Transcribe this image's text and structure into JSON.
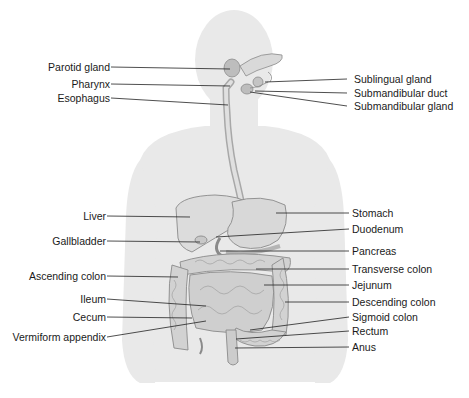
{
  "colors": {
    "silhouette": "#e9e9e9",
    "organ_fill": "#d6d6d6",
    "organ_stroke": "#8a8a8a",
    "leader_line": "#222222",
    "text": "#1a1a1a"
  },
  "labels_left": [
    {
      "id": "parotid-gland",
      "text": "Parotid gland"
    },
    {
      "id": "pharynx",
      "text": "Pharynx"
    },
    {
      "id": "esophagus",
      "text": "Esophagus"
    },
    {
      "id": "liver",
      "text": "Liver"
    },
    {
      "id": "gallbladder",
      "text": "Gallbladder"
    },
    {
      "id": "ascending-colon",
      "text": "Ascending colon"
    },
    {
      "id": "ileum",
      "text": "Ileum"
    },
    {
      "id": "cecum",
      "text": "Cecum"
    },
    {
      "id": "vermiform-appendix",
      "text": "Vermiform appendix"
    }
  ],
  "labels_right": [
    {
      "id": "sublingual-gland",
      "text": "Sublingual gland"
    },
    {
      "id": "submandibular-duct",
      "text": "Submandibular duct"
    },
    {
      "id": "submandibular-gland",
      "text": "Submandibular gland"
    },
    {
      "id": "stomach",
      "text": "Stomach"
    },
    {
      "id": "duodenum",
      "text": "Duodenum"
    },
    {
      "id": "pancreas",
      "text": "Pancreas"
    },
    {
      "id": "transverse-colon",
      "text": "Transverse colon"
    },
    {
      "id": "jejunum",
      "text": "Jejunum"
    },
    {
      "id": "descending-colon",
      "text": "Descending colon"
    },
    {
      "id": "sigmoid-colon",
      "text": "Sigmoid colon"
    },
    {
      "id": "rectum",
      "text": "Rectum"
    },
    {
      "id": "anus",
      "text": "Anus"
    }
  ]
}
